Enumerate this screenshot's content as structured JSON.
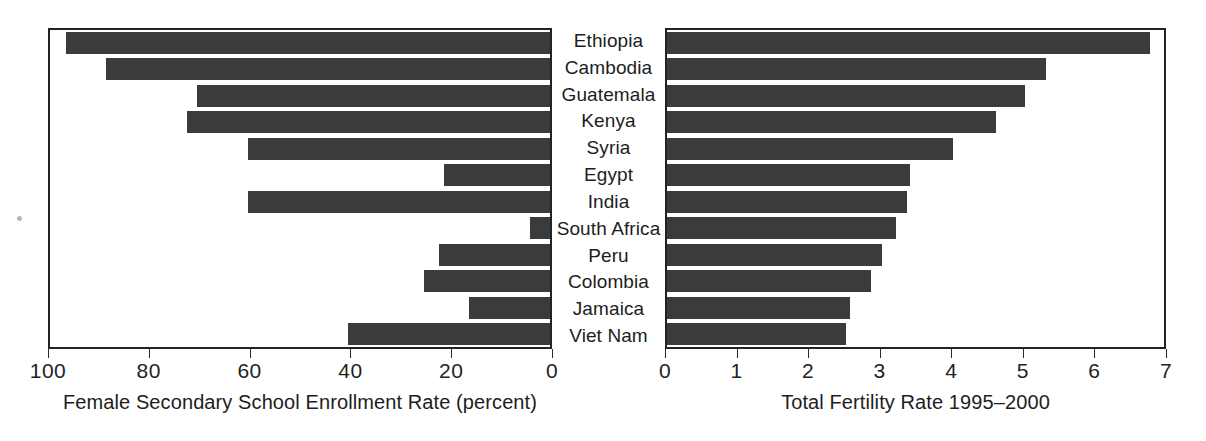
{
  "chart_data": {
    "type": "bar",
    "orientation": "horizontal",
    "layout": "paired-back-to-back-panels",
    "title": "",
    "categories": [
      "Ethiopia",
      "Cambodia",
      "Guatemala",
      "Kenya",
      "Syria",
      "Egypt",
      "India",
      "South Africa",
      "Peru",
      "Colombia",
      "Jamaica",
      "Viet Nam"
    ],
    "series": [
      {
        "name": "Female Secondary School Enrollment Rate (percent)",
        "panel": "left",
        "direction": "right-to-left",
        "xlabel": "Female Secondary School Enrollment Rate (percent)",
        "xlim": [
          100,
          0
        ],
        "ticks": [
          100,
          80,
          60,
          40,
          20,
          0
        ],
        "tick_labels": [
          "100",
          "80",
          "60",
          "40",
          "20",
          "0"
        ],
        "values": [
          4,
          12,
          30,
          28,
          40,
          79,
          40,
          96,
          78,
          75,
          84,
          60
        ]
      },
      {
        "name": "Total Fertility Rate 1995-2000",
        "panel": "right",
        "direction": "left-to-right",
        "xlabel": "Total Fertility Rate 1995–2000",
        "xlim": [
          0,
          7
        ],
        "ticks": [
          0,
          1,
          2,
          3,
          4,
          5,
          6,
          7
        ],
        "tick_labels": [
          "0",
          "1",
          "2",
          "3",
          "4",
          "5",
          "6",
          "7"
        ],
        "values": [
          6.75,
          5.3,
          5.0,
          4.6,
          4.0,
          3.4,
          3.35,
          3.2,
          3.0,
          2.85,
          2.55,
          2.5
        ]
      }
    ],
    "grid": false,
    "legend": null,
    "bar_color": "#3b3b3b",
    "frame_color": "#232323",
    "background": "#ffffff"
  },
  "left_panel": {
    "axis_title": "Female Secondary School Enrollment Rate (percent)",
    "tick_labels": [
      "100",
      "80",
      "60",
      "40",
      "20",
      "0"
    ]
  },
  "right_panel": {
    "axis_title": "Total Fertility Rate 1995–2000",
    "tick_labels": [
      "0",
      "1",
      "2",
      "3",
      "4",
      "5",
      "6",
      "7"
    ]
  }
}
